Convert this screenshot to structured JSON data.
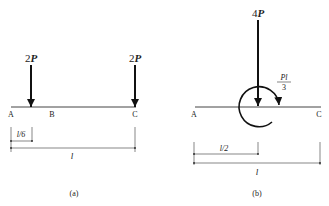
{
  "figure_a": {
    "caption": "(a)",
    "loads": [
      {
        "coef": "2",
        "sym": "P",
        "position": "l/6 from A"
      },
      {
        "coef": "2",
        "sym": "P",
        "position": "at C"
      }
    ],
    "points": [
      "A",
      "B",
      "C"
    ],
    "dims": {
      "short": "l/6",
      "total": "l"
    }
  },
  "figure_b": {
    "caption": "(b)",
    "load": {
      "coef": "4",
      "sym": "P"
    },
    "moment": {
      "num": "Pl",
      "den": "3"
    },
    "points": [
      "A",
      "C"
    ],
    "dims": {
      "short": "l/2",
      "total": "l"
    }
  },
  "colors": {
    "line": "#222222",
    "dim": "#555555"
  }
}
